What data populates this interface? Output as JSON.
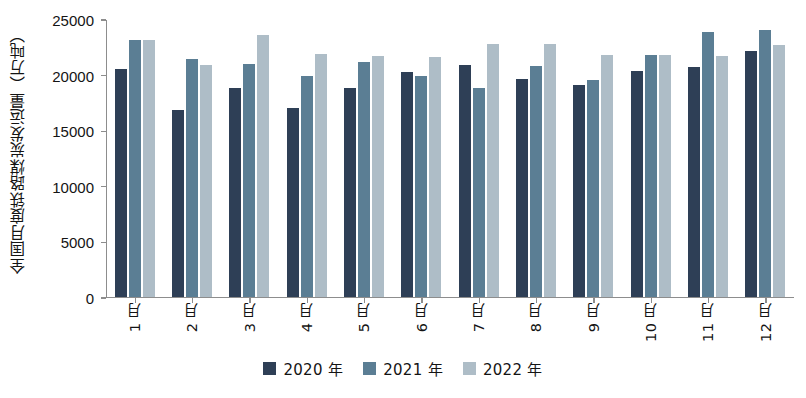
{
  "chart_data": {
    "type": "bar",
    "title": "",
    "xlabel": "",
    "ylabel": "全国月度铁路煤炭发运量（万吨）",
    "ylim": [
      0,
      25000
    ],
    "yticks": [
      0,
      5000,
      10000,
      15000,
      20000,
      25000
    ],
    "ytick_labels": [
      "0",
      "5000",
      "10000",
      "15000",
      "20000",
      "25000"
    ],
    "grid": false,
    "legend_position": "bottom",
    "categories": [
      "1 月",
      "2 月",
      "3 月",
      "4 月",
      "5 月",
      "6 月",
      "7 月",
      "8 月",
      "9 月",
      "10 月",
      "11 月",
      "12 月"
    ],
    "series": [
      {
        "name": "2020 年",
        "color": "#2e3f56",
        "values": [
          20500,
          16800,
          18800,
          17000,
          18800,
          20200,
          20900,
          19600,
          19100,
          20300,
          20700,
          22100
        ]
      },
      {
        "name": "2021 年",
        "color": "#5b7e94",
        "values": [
          23100,
          21400,
          21000,
          19900,
          21100,
          19900,
          18800,
          20800,
          19500,
          21800,
          23800,
          24000
        ]
      },
      {
        "name": "2022 年",
        "color": "#aebdc7",
        "values": [
          23100,
          20900,
          23600,
          21900,
          21700,
          21600,
          22800,
          22800,
          21800,
          21800,
          21700,
          22700
        ]
      }
    ]
  }
}
